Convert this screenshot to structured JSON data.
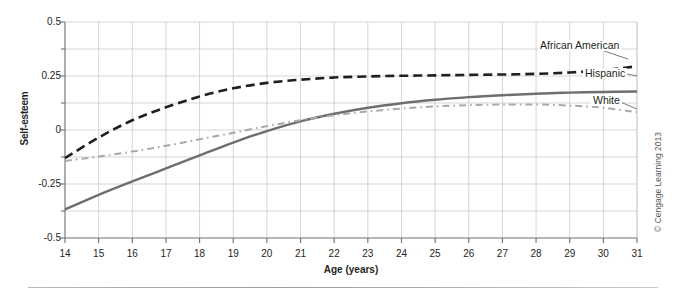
{
  "chart_data": {
    "type": "line",
    "title": "",
    "xlabel": "Age (years)",
    "ylabel": "Self-esteem",
    "xlim": [
      14,
      31
    ],
    "ylim": [
      -0.5,
      0.5
    ],
    "grid": true,
    "legend_position": "inline-right",
    "x_ticks": [
      14,
      15,
      16,
      17,
      18,
      19,
      20,
      21,
      22,
      23,
      24,
      25,
      26,
      27,
      28,
      29,
      30,
      31
    ],
    "x_tick_labels": [
      "14",
      "15",
      "16",
      "17",
      "18",
      "19",
      "20",
      "21",
      "22",
      "23",
      "24",
      "25",
      "26",
      "27",
      "28",
      "29",
      "30",
      "31"
    ],
    "y_ticks": [
      -0.5,
      -0.25,
      0,
      0.25,
      0.5
    ],
    "y_tick_labels": [
      "-0.5",
      "-0.25",
      "0",
      "0.25",
      "0.5"
    ],
    "y_gridlines": [
      -0.5,
      -0.375,
      -0.25,
      -0.125,
      0,
      0.125,
      0.25,
      0.375,
      0.5
    ],
    "x": [
      14,
      15,
      16,
      17,
      18,
      19,
      20,
      21,
      22,
      23,
      24,
      25,
      26,
      27,
      28,
      29,
      30,
      31
    ],
    "series": [
      {
        "name": "African American",
        "style": "dashed",
        "color": "#231f20",
        "values": [
          -0.13,
          -0.035,
          0.045,
          0.105,
          0.155,
          0.193,
          0.218,
          0.233,
          0.243,
          0.248,
          0.251,
          0.253,
          0.255,
          0.257,
          0.26,
          0.266,
          0.277,
          0.295
        ]
      },
      {
        "name": "Hispanic",
        "style": "solid",
        "color": "#6d6e71",
        "values": [
          -0.368,
          -0.3,
          -0.238,
          -0.178,
          -0.118,
          -0.058,
          -0.005,
          0.04,
          0.075,
          0.103,
          0.124,
          0.14,
          0.152,
          0.161,
          0.168,
          0.173,
          0.176,
          0.178
        ]
      },
      {
        "name": "White",
        "style": "dash-dot",
        "color": "#a7a9ac",
        "values": [
          -0.143,
          -0.123,
          -0.1,
          -0.073,
          -0.043,
          -0.013,
          0.018,
          0.045,
          0.068,
          0.086,
          0.099,
          0.109,
          0.115,
          0.118,
          0.118,
          0.113,
          0.103,
          0.082
        ]
      }
    ]
  },
  "axes": {
    "y_title": "Self-esteem",
    "x_title": "Age (years)"
  },
  "credit": {
    "text": "© Cengage Learning 2013"
  }
}
